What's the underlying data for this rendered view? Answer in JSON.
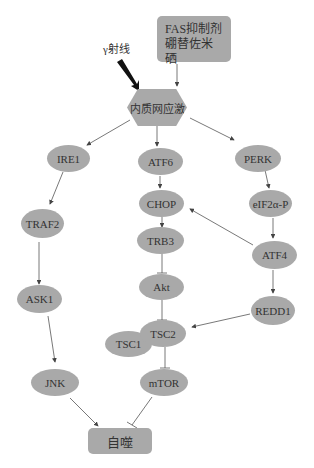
{
  "diagram": {
    "nodes": {
      "fas": {
        "label": "FAS抑制剂\n硼替佐米\n硒",
        "shape": "rounded-rect"
      },
      "gamma": {
        "label": "γ射线",
        "shape": "text"
      },
      "er_stress": {
        "label": "内质网应激",
        "shape": "hexagon"
      },
      "ire1": {
        "label": "IRE1",
        "shape": "ellipse"
      },
      "atf6": {
        "label": "ATF6",
        "shape": "ellipse"
      },
      "perk": {
        "label": "PERK",
        "shape": "ellipse"
      },
      "traf2": {
        "label": "TRAF2",
        "shape": "ellipse"
      },
      "chop": {
        "label": "CHOP",
        "shape": "ellipse"
      },
      "eif2a": {
        "label": "eIF2α-P",
        "shape": "ellipse"
      },
      "trb3": {
        "label": "TRB3",
        "shape": "ellipse"
      },
      "atf4": {
        "label": "ATF4",
        "shape": "ellipse"
      },
      "ask1": {
        "label": "ASK1",
        "shape": "ellipse"
      },
      "akt": {
        "label": "Akt",
        "shape": "ellipse"
      },
      "redd1": {
        "label": "REDD1",
        "shape": "ellipse"
      },
      "tsc2": {
        "label": "TSC2",
        "shape": "ellipse"
      },
      "tsc1": {
        "label": "TSC1",
        "shape": "ellipse"
      },
      "jnk": {
        "label": "JNK",
        "shape": "ellipse"
      },
      "mtor": {
        "label": "mTOR",
        "shape": "ellipse"
      },
      "autophagy": {
        "label": "自噬",
        "shape": "rounded-rect"
      }
    },
    "edges": [
      {
        "from": "gamma",
        "to": "er_stress",
        "type": "bold-arrow"
      },
      {
        "from": "fas",
        "to": "er_stress",
        "type": "arrow"
      },
      {
        "from": "er_stress",
        "to": "ire1",
        "type": "arrow"
      },
      {
        "from": "er_stress",
        "to": "atf6",
        "type": "arrow"
      },
      {
        "from": "er_stress",
        "to": "perk",
        "type": "arrow"
      },
      {
        "from": "ire1",
        "to": "traf2",
        "type": "arrow"
      },
      {
        "from": "traf2",
        "to": "ask1",
        "type": "arrow"
      },
      {
        "from": "ask1",
        "to": "jnk",
        "type": "arrow"
      },
      {
        "from": "jnk",
        "to": "autophagy",
        "type": "arrow"
      },
      {
        "from": "atf6",
        "to": "chop",
        "type": "arrow"
      },
      {
        "from": "chop",
        "to": "trb3",
        "type": "arrow"
      },
      {
        "from": "trb3",
        "to": "akt",
        "type": "inhibit"
      },
      {
        "from": "akt",
        "to": "tsc2",
        "type": "inhibit"
      },
      {
        "from": "tsc2",
        "to": "mtor",
        "type": "inhibit"
      },
      {
        "from": "mtor",
        "to": "autophagy",
        "type": "inhibit"
      },
      {
        "from": "perk",
        "to": "eif2a",
        "type": "arrow"
      },
      {
        "from": "eif2a",
        "to": "atf4",
        "type": "arrow"
      },
      {
        "from": "atf4",
        "to": "chop",
        "type": "arrow"
      },
      {
        "from": "atf4",
        "to": "redd1",
        "type": "arrow"
      },
      {
        "from": "redd1",
        "to": "tsc2",
        "type": "arrow"
      }
    ],
    "colors": {
      "node_fill": "#a9a9a9",
      "edge": "#444444",
      "text": "#333333"
    }
  }
}
